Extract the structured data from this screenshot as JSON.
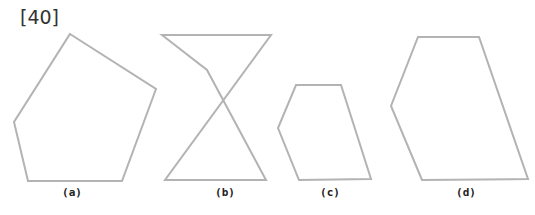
{
  "question_number": "[40]",
  "figures": [
    {
      "label": "(a)",
      "name": "pentagon",
      "points": "70,34 156,89 122,181 28,181 14,122",
      "label_x": 72
    },
    {
      "label": "(b)",
      "name": "self-intersecting-figure",
      "points": "162,35 207,70 266,180 165,180 271,35",
      "label_x": 225
    },
    {
      "label": "(c)",
      "name": "pentagon-small",
      "points": "296,85 341,85 371,179 299,180 278,128",
      "label_x": 330
    },
    {
      "label": "(d)",
      "name": "pentagon-large",
      "points": "418,37 479,37 528,179 422,180 391,106",
      "label_x": 466
    }
  ],
  "colors": {
    "stroke": "#b3b3b3",
    "text": "#222222"
  }
}
